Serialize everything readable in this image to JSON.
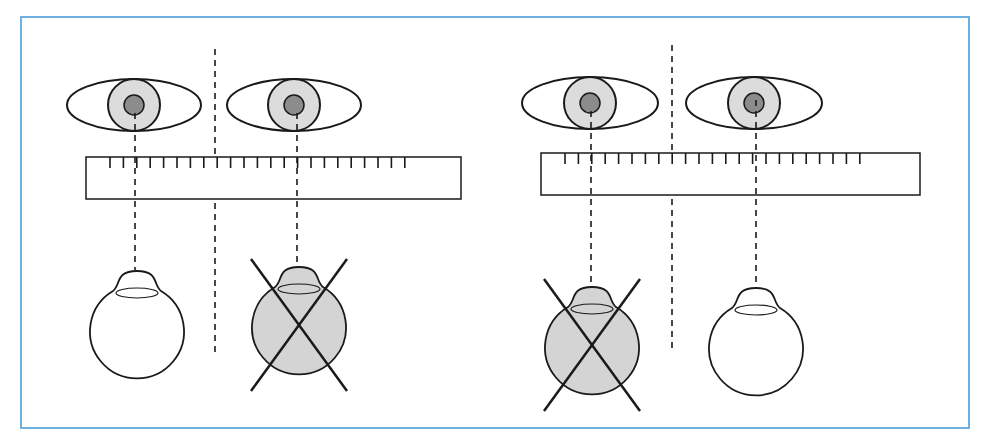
{
  "colors": {
    "frame": "#6fb0e0",
    "stroke": "#1a1a1a",
    "iris": "#dcdcdc",
    "pupil": "#8c8c8c",
    "crossed_eyeball": "#d4d4d4",
    "background": "#ffffff"
  },
  "panels": [
    {
      "id": "left-panel",
      "midline_x": 215,
      "midline_y": [
        49,
        355
      ],
      "ruler": {
        "x": 86,
        "y": 157,
        "w": 375,
        "h": 42,
        "tick_start": 110,
        "tick_step": 13.4,
        "tick_count": 23,
        "tick_len": 11
      },
      "eyes": [
        {
          "label": "right-eye",
          "cx": 134,
          "cy": 105,
          "rx": 67,
          "ry": 26,
          "iris_r": 26,
          "pupil_r": 10
        },
        {
          "label": "left-eye",
          "cx": 294,
          "cy": 105,
          "rx": 67,
          "ry": 26,
          "iris_r": 26,
          "pupil_r": 10
        }
      ],
      "projections": [
        {
          "x": 135,
          "y1": 113,
          "y2": 270
        },
        {
          "x": 297,
          "y1": 113,
          "y2": 272
        }
      ],
      "eyeballs": [
        {
          "label": "fixing-eye",
          "cx": 137,
          "cy": 330,
          "r": 47,
          "crossed": false
        },
        {
          "label": "deviating-eye",
          "cx": 299,
          "cy": 326,
          "r": 47,
          "crossed": true
        }
      ]
    },
    {
      "id": "right-panel",
      "midline_x": 672,
      "midline_y": [
        45,
        353
      ],
      "ruler": {
        "x": 541,
        "y": 153,
        "w": 379,
        "h": 42,
        "tick_start": 565,
        "tick_step": 13.4,
        "tick_count": 23,
        "tick_len": 11
      },
      "eyes": [
        {
          "label": "right-eye",
          "cx": 590,
          "cy": 103,
          "rx": 68,
          "ry": 26,
          "iris_r": 26,
          "pupil_r": 10
        },
        {
          "label": "left-eye",
          "cx": 754,
          "cy": 103,
          "rx": 68,
          "ry": 26,
          "iris_r": 26,
          "pupil_r": 10
        }
      ],
      "projections": [
        {
          "x": 591,
          "y1": 111,
          "y2": 288
        },
        {
          "x": 756,
          "y1": 100,
          "y2": 291
        }
      ],
      "eyeballs": [
        {
          "label": "deviating-eye",
          "cx": 592,
          "cy": 346,
          "r": 47,
          "crossed": true
        },
        {
          "label": "fixing-eye",
          "cx": 756,
          "cy": 347,
          "r": 47,
          "crossed": false
        }
      ]
    }
  ]
}
